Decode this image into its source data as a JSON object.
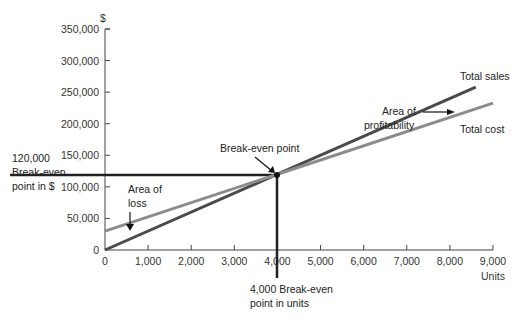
{
  "chart_data": {
    "type": "line",
    "title": "",
    "xlabel": "Units",
    "ylabel": "$",
    "xlim": [
      0,
      9000
    ],
    "ylim": [
      0,
      350000
    ],
    "x_ticks": [
      "0",
      "1,000",
      "2,000",
      "3,000",
      "4,000",
      "5,000",
      "6,000",
      "7,000",
      "8,000",
      "9,000"
    ],
    "y_ticks": [
      "0",
      "50,000",
      "100,000",
      "150,000",
      "200,000",
      "250,000",
      "300,000",
      "350,000"
    ],
    "grid": false,
    "series": [
      {
        "name": "Total sales",
        "x": [
          0,
          4000,
          8600
        ],
        "values": [
          0,
          120000,
          258000
        ],
        "color": "#4a4a4a"
      },
      {
        "name": "Total cost",
        "x": [
          0,
          4000,
          9000
        ],
        "values": [
          30000,
          120000,
          232500
        ],
        "color": "#8c8c8c"
      }
    ],
    "break_even": {
      "units": 4000,
      "dollars": 120000
    },
    "annotations": {
      "break_even_point": "Break-even point",
      "area_loss_1": "Area of",
      "area_loss_2": "loss",
      "area_profit_1": "Area of",
      "area_profit_2": "profitability",
      "be_dollars_1": "120,000",
      "be_dollars_2": "Break-even",
      "be_dollars_3": "point in $",
      "be_units_1": "4,000 Break-even",
      "be_units_2": "point in units",
      "total_sales": "Total sales",
      "total_cost": "Total cost"
    }
  }
}
